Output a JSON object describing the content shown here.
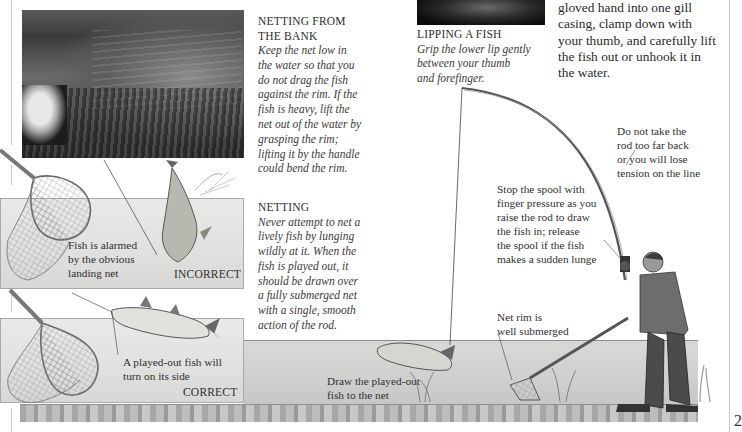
{
  "page": {
    "number_partial": "2"
  },
  "netting_from_bank": {
    "title_line1": "NETTING FROM",
    "title_line2": "THE BANK",
    "body_lines": [
      "Keep the net low in",
      "the water so that you",
      "do not drag the fish",
      "against the rim. If the",
      "fish is heavy, lift the",
      "net out of the water by",
      "grasping the rim;",
      "lifting it by the handle",
      "could bend the rim."
    ]
  },
  "lipping_a_fish": {
    "title": "LIPPING A FISH",
    "body_lines": [
      "Grip the lower lip gently",
      "between your thumb",
      "and forefinger."
    ]
  },
  "gill_text": {
    "lines": [
      "gloved hand into one gill",
      "casing, clamp down with",
      "your thumb, and carefully lift",
      "the fish out or unhook it in",
      "the water."
    ]
  },
  "netting": {
    "title": "NETTING",
    "body_lines": [
      "Never attempt to net a",
      "lively fish by lunging",
      "wildly at it. When the",
      "fish is played out, it",
      "should be drawn over",
      "a fully submerged net",
      "with a single, smooth",
      "action of the rod."
    ]
  },
  "incorrect_panel": {
    "label_lines": [
      "Fish is alarmed",
      "by the obvious",
      "landing net"
    ],
    "verdict": "INCORRECT"
  },
  "correct_panel": {
    "label_lines": [
      "A played-out fish will",
      "turn on its side"
    ],
    "verdict": "CORRECT"
  },
  "scene_labels": {
    "rod_tension": [
      "Do not take the",
      "rod too far back",
      "or you will lose",
      "tension on the line"
    ],
    "spool": [
      "Stop the spool with",
      "finger pressure as you",
      "raise the rod to draw",
      "the fish in; release",
      "the spool if the fish",
      "makes a sudden lunge"
    ],
    "net_rim": [
      "Net rim is",
      "well submerged"
    ],
    "draw_fish": [
      "Draw the played-out",
      "fish to the net"
    ]
  },
  "colors": {
    "text": "#2a2a2a",
    "panel_bg": "#e3e3e1",
    "panel_border": "#a9a9a9",
    "line": "#555555"
  }
}
